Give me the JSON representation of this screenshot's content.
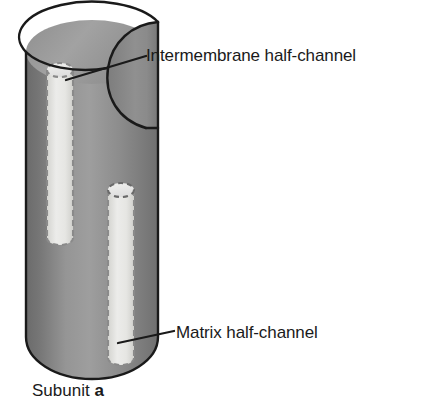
{
  "figure": {
    "background_color": "#ffffff",
    "caption": {
      "text": "Subunit ",
      "letter": "a",
      "full_text": "Subunit a"
    },
    "labels": {
      "intermembrane": "Intermembrane half-channel",
      "matrix": "Matrix half-channel"
    },
    "colors": {
      "outline": "#1a1a1a",
      "body_dark": "#6f6f6f",
      "body_mid": "#8a8a8a",
      "body_light": "#a6a6a6",
      "top_face": "#9a9a9a",
      "cut_face": "#818181",
      "inner_wall": "#8e8e8e",
      "channel_fill": "#e3e3e0",
      "channel_dash": "#8c8c8c",
      "text": "#1a1a1a"
    },
    "diagram": {
      "type": "cutaway-cylinder",
      "subject": "Subunit a",
      "channels": [
        {
          "name": "Intermembrane half-channel",
          "position": "upper-left",
          "opens_toward": "top",
          "fill": "#e3e3e0",
          "outline_style": "dashed"
        },
        {
          "name": "Matrix half-channel",
          "position": "lower-right",
          "opens_toward": "bottom",
          "fill": "#e3e3e0",
          "outline_style": "dashed"
        }
      ]
    }
  }
}
